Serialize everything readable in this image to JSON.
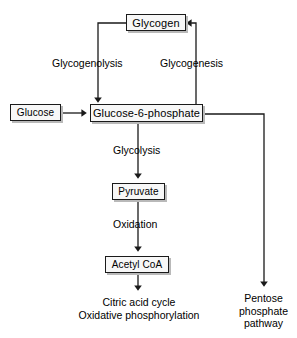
{
  "figure": {
    "background_color": "#ffffff",
    "box_fill_color": "#f7f7f7",
    "box_border_color": "#1a1a1a",
    "box_shadow_color": "#b9b9b9",
    "line_color": "#1a1a1a",
    "text_color": "#000000",
    "caption": "",
    "nodes": [
      {
        "id": "glycogen",
        "label": "Glycogen",
        "type": "box",
        "x": 126,
        "y": 14,
        "w": 60,
        "h": 17,
        "font_size": 11
      },
      {
        "id": "glucose",
        "label": "Glucose",
        "type": "box",
        "x": 10,
        "y": 104,
        "w": 51,
        "h": 17,
        "font_size": 10
      },
      {
        "id": "g6p",
        "label": "Glucose-6-phosphate",
        "type": "box",
        "x": 90,
        "y": 104,
        "w": 113,
        "h": 18,
        "font_size": 11
      },
      {
        "id": "pyruvate",
        "label": "Pyruvate",
        "type": "box",
        "x": 112,
        "y": 183,
        "w": 53,
        "h": 17,
        "font_size": 10
      },
      {
        "id": "acetyl_coa",
        "label": "Acetyl CoA",
        "type": "box",
        "x": 105,
        "y": 256,
        "w": 64,
        "h": 17,
        "font_size": 10
      }
    ],
    "edge_labels": [
      {
        "id": "glycogenolysis",
        "label": "Glycogenolysis",
        "x": 52,
        "y": 57,
        "font_size": 10.5
      },
      {
        "id": "glycogenesis",
        "label": "Glycogenesis",
        "x": 160,
        "y": 57,
        "font_size": 10.5
      },
      {
        "id": "glycolysis",
        "label": "Glycolysis",
        "x": 113,
        "y": 144,
        "font_size": 10.5
      },
      {
        "id": "oxidation",
        "label": "Oxidation",
        "x": 113,
        "y": 218,
        "font_size": 10.5
      }
    ],
    "text_nodes": [
      {
        "id": "citric-acid-cycle",
        "lines": [
          "Citric acid cycle",
          "Oxidative phosphorylation"
        ],
        "x": 46,
        "y": 296,
        "w": 186,
        "font_size": 10.5
      },
      {
        "id": "pentose-phosphate-pathway",
        "lines": [
          "Pentose",
          "phosphate",
          "pathway"
        ],
        "x": 232,
        "y": 292,
        "w": 63,
        "font_size": 10.5
      }
    ],
    "edges": [
      {
        "id": "glucose-to-g6p",
        "from": "glucose",
        "to": "g6p",
        "arrow": true
      },
      {
        "id": "glycogen-to-g6p",
        "from": "glycogen",
        "to": "g6p",
        "arrow": true,
        "label": "glycogenolysis"
      },
      {
        "id": "g6p-to-glycogen",
        "from": "g6p",
        "to": "glycogen",
        "arrow": true,
        "label": "glycogenesis"
      },
      {
        "id": "g6p-to-pyruvate",
        "from": "g6p",
        "to": "pyruvate",
        "arrow": true,
        "label": "glycolysis"
      },
      {
        "id": "pyruvate-to-acetyl-coa",
        "from": "pyruvate",
        "to": "acetyl_coa",
        "arrow": true,
        "label": "oxidation"
      },
      {
        "id": "acetyl-coa-to-citric-acid-cycle",
        "from": "acetyl_coa",
        "to": "citric-acid-cycle",
        "arrow": true
      },
      {
        "id": "g6p-to-pentose-phosphate-pathway",
        "from": "g6p",
        "to": "pentose-phosphate-pathway",
        "arrow": true
      }
    ]
  }
}
